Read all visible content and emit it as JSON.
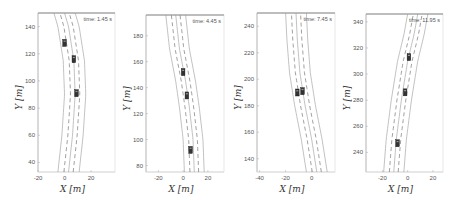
{
  "chart_data": [
    {
      "type": "line",
      "title": "",
      "annotation": "time: 1.45 s",
      "xlabel": "X [m]",
      "ylabel": "Y [m]",
      "xlim": [
        -20,
        38
      ],
      "ylim": [
        33,
        150
      ],
      "xticks": [
        -20,
        0,
        20
      ],
      "yticks": [
        40,
        60,
        80,
        100,
        120,
        140
      ],
      "grid": false,
      "box": {
        "left": 38,
        "top": 13,
        "right": 115,
        "bottom": 172
      },
      "road": {
        "centerline": [
          [
            3,
            33
          ],
          [
            6,
            60
          ],
          [
            8,
            90
          ],
          [
            7,
            115
          ],
          [
            3,
            140
          ],
          [
            0,
            150
          ]
        ],
        "lane_offsets": [
          -8,
          -3.5,
          0,
          3.5,
          8
        ],
        "dashed_offsets": [
          -3.5,
          3.5
        ]
      },
      "vehicles": [
        {
          "x": 0,
          "y": 128
        },
        {
          "x": 7,
          "y": 116
        },
        {
          "x": 9,
          "y": 91
        }
      ]
    },
    {
      "type": "line",
      "title": "",
      "annotation": "time: 4.45 s",
      "xlabel": "X [m]",
      "ylabel": "Y [m]",
      "xlim": [
        -30,
        33
      ],
      "ylim": [
        75,
        196
      ],
      "xticks": [
        -20,
        0,
        20
      ],
      "yticks": [
        80,
        100,
        120,
        140,
        160,
        180
      ],
      "grid": false,
      "box": {
        "left": 146,
        "top": 15,
        "right": 224,
        "bottom": 172
      },
      "road": {
        "centerline": [
          [
            9,
            75
          ],
          [
            8,
            100
          ],
          [
            5,
            125
          ],
          [
            2,
            145
          ],
          [
            -3,
            170
          ],
          [
            -6,
            196
          ]
        ],
        "lane_offsets": [
          -8,
          -3.5,
          0,
          3.5,
          8
        ],
        "dashed_offsets": [
          -3.5,
          3.5
        ]
      },
      "vehicles": [
        {
          "x": 0,
          "y": 152
        },
        {
          "x": 3,
          "y": 134
        },
        {
          "x": 6,
          "y": 92
        }
      ]
    },
    {
      "type": "line",
      "title": "",
      "annotation": "time: 7.45 s",
      "xlabel": "X [m]",
      "ylabel": "Y [m]",
      "xlim": [
        -42,
        18
      ],
      "ylim": [
        130,
        250
      ],
      "xticks": [
        -40,
        -20,
        0
      ],
      "yticks": [
        140,
        160,
        180,
        200,
        220,
        240
      ],
      "grid": false,
      "box": {
        "left": 257,
        "top": 13,
        "right": 335,
        "bottom": 172
      },
      "road": {
        "centerline": [
          [
            4,
            130
          ],
          [
            0,
            155
          ],
          [
            -5,
            180
          ],
          [
            -9,
            205
          ],
          [
            -11,
            230
          ],
          [
            -12,
            250
          ]
        ],
        "lane_offsets": [
          -8,
          -3.5,
          0,
          3.5,
          8
        ],
        "dashed_offsets": [
          -3.5,
          3.5
        ]
      },
      "vehicles": [
        {
          "x": -11,
          "y": 190
        },
        {
          "x": -7,
          "y": 191
        }
      ]
    },
    {
      "type": "line",
      "title": "",
      "annotation": "time: 11.95 s",
      "xlabel": "X [m]",
      "ylabel": "Y [m]",
      "xlim": [
        -33,
        28
      ],
      "ylim": [
        225,
        346
      ],
      "xticks": [
        -20,
        0,
        20
      ],
      "yticks": [
        240,
        260,
        280,
        300,
        320,
        340
      ],
      "grid": false,
      "box": {
        "left": 366,
        "top": 14,
        "right": 443,
        "bottom": 172
      },
      "road": {
        "centerline": [
          [
            -11,
            225
          ],
          [
            -9,
            250
          ],
          [
            -5,
            280
          ],
          [
            0,
            310
          ],
          [
            5,
            330
          ],
          [
            8,
            346
          ]
        ],
        "lane_offsets": [
          -8,
          -3.5,
          0,
          3.5,
          8
        ],
        "dashed_offsets": [
          -3.5,
          3.5
        ]
      },
      "vehicles": [
        {
          "x": -8,
          "y": 247
        },
        {
          "x": -2,
          "y": 286
        },
        {
          "x": 1,
          "y": 313
        }
      ]
    }
  ]
}
